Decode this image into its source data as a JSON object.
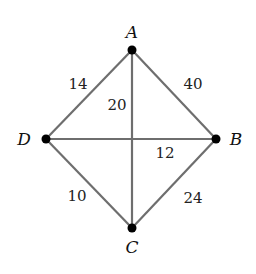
{
  "graph": {
    "nodes": [
      {
        "id": "A",
        "label": "A",
        "x": 132,
        "y": 50,
        "lx": 132,
        "ly": 38
      },
      {
        "id": "B",
        "label": "B",
        "x": 216,
        "y": 139,
        "lx": 236,
        "ly": 145
      },
      {
        "id": "C",
        "label": "C",
        "x": 132,
        "y": 228,
        "lx": 132,
        "ly": 253
      },
      {
        "id": "D",
        "label": "D",
        "x": 46,
        "y": 139,
        "lx": 24,
        "ly": 145
      }
    ],
    "edges": [
      {
        "from": "A",
        "to": "D",
        "weight": "14",
        "wx": 78,
        "wy": 89
      },
      {
        "from": "A",
        "to": "B",
        "weight": "40",
        "wx": 193,
        "wy": 89
      },
      {
        "from": "A",
        "to": "C",
        "weight": "20",
        "wx": 117,
        "wy": 110
      },
      {
        "from": "D",
        "to": "B",
        "weight": "12",
        "wx": 165,
        "wy": 158
      },
      {
        "from": "D",
        "to": "C",
        "weight": "10",
        "wx": 77,
        "wy": 201
      },
      {
        "from": "B",
        "to": "C",
        "weight": "24",
        "wx": 193,
        "wy": 203
      }
    ]
  },
  "colors": {
    "edge": "#6e6e6e",
    "node": "#000000",
    "text": "#111111"
  }
}
